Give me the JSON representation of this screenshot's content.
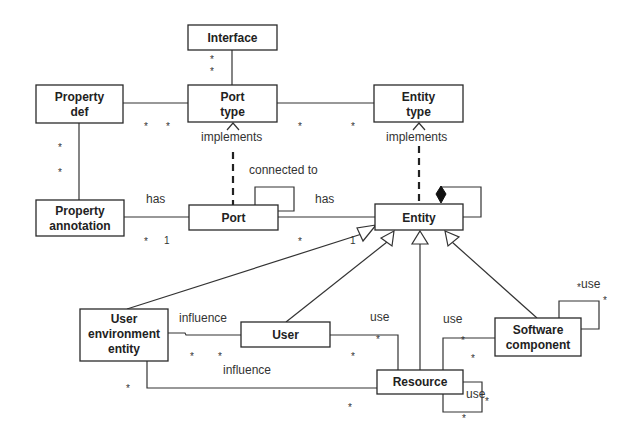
{
  "diagram": {
    "type": "UML class diagram",
    "classes": {
      "interface": {
        "label": "Interface"
      },
      "property_def": {
        "line1": "Property",
        "line2": "def"
      },
      "port_type": {
        "line1": "Port",
        "line2": "type"
      },
      "entity_type": {
        "line1": "Entity",
        "line2": "type"
      },
      "property_annotation": {
        "line1": "Property",
        "line2": "annotation"
      },
      "port": {
        "label": "Port"
      },
      "entity": {
        "label": "Entity"
      },
      "user_environment_entity": {
        "line1": "User",
        "line2": "environment",
        "line3": "entity"
      },
      "user": {
        "label": "User"
      },
      "resource": {
        "label": "Resource"
      },
      "software_component": {
        "line1": "Software",
        "line2": "component"
      }
    },
    "labels": {
      "implements_port": "implements",
      "implements_entity": "implements",
      "connected_to": "connected to",
      "has_annotation": "has",
      "has_entity": "has",
      "influence_user": "influence",
      "influence_resource": "influence",
      "use_user_resource": "use",
      "use_sw_resource": "use",
      "use_sw_self": "use",
      "use_resource_self": "use"
    },
    "multiplicities": {
      "star": "*",
      "one": "1"
    },
    "relationships": [
      {
        "from": "Interface",
        "to": "Port type",
        "kind": "association",
        "mult_to": "* *"
      },
      {
        "from": "Property def",
        "to": "Port type",
        "kind": "association",
        "mult": "* *"
      },
      {
        "from": "Port type",
        "to": "Entity type",
        "kind": "association",
        "mult": "* *"
      },
      {
        "from": "Property def",
        "to": "Property annotation",
        "kind": "association",
        "mult": "* *"
      },
      {
        "from": "Port",
        "to": "Port type",
        "kind": "dependency",
        "label": "implements"
      },
      {
        "from": "Entity",
        "to": "Entity type",
        "kind": "dependency",
        "label": "implements"
      },
      {
        "from": "Port",
        "to": "Port",
        "kind": "association",
        "label": "connected to"
      },
      {
        "from": "Property annotation",
        "to": "Port",
        "kind": "association",
        "label": "has",
        "mult": "* 1"
      },
      {
        "from": "Port",
        "to": "Entity",
        "kind": "association",
        "label": "has",
        "mult": "* 1"
      },
      {
        "from": "Entity",
        "to": "Entity",
        "kind": "composition"
      },
      {
        "from": "User environment entity",
        "to": "Entity",
        "kind": "generalization"
      },
      {
        "from": "User",
        "to": "Entity",
        "kind": "generalization"
      },
      {
        "from": "Resource",
        "to": "Entity",
        "kind": "generalization"
      },
      {
        "from": "Software component",
        "to": "Entity",
        "kind": "generalization"
      },
      {
        "from": "User",
        "to": "User environment entity",
        "kind": "association",
        "label": "influence",
        "mult": "* *"
      },
      {
        "from": "Resource",
        "to": "User environment entity",
        "kind": "association",
        "label": "influence",
        "mult": "* *"
      },
      {
        "from": "User",
        "to": "Resource",
        "kind": "association",
        "label": "use",
        "mult": "* *"
      },
      {
        "from": "Software component",
        "to": "Resource",
        "kind": "association",
        "label": "use",
        "mult": "* *"
      },
      {
        "from": "Software component",
        "to": "Software component",
        "kind": "association",
        "label": "use",
        "mult": "* *"
      },
      {
        "from": "Resource",
        "to": "Resource",
        "kind": "association",
        "label": "use",
        "mult": "* *"
      }
    ]
  }
}
